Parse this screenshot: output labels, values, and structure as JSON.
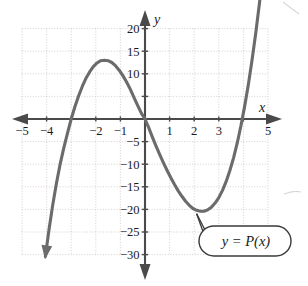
{
  "figure": {
    "axis_labels": {
      "x": "x",
      "y": "y"
    },
    "callout_text": "y = P(x)",
    "x_tick_labels": [
      "−5",
      "−4",
      "−2",
      "−1",
      "1",
      "2",
      "3",
      "5"
    ],
    "y_tick_labels": [
      "20",
      "15",
      "10",
      "−5",
      "−10",
      "−15",
      "−20",
      "−25",
      "−30"
    ],
    "colors": {
      "curve": "#6b6b6b",
      "axis": "#4a4a4a",
      "grid": "#c9b9b9",
      "text": "#1a1a1a",
      "callout_border": "#3a3a3a",
      "background": "#ffffff"
    }
  },
  "chart_data": {
    "type": "line",
    "title": "",
    "subtitle": "",
    "xlabel": "x",
    "ylabel": "y",
    "xlim": [
      -5,
      5
    ],
    "ylim": [
      -30,
      20
    ],
    "grid": true,
    "grid_x_step": 1,
    "grid_y_step": 5,
    "x_ticks": [
      -5,
      -4,
      -3,
      -2,
      -1,
      1,
      2,
      3,
      4,
      5
    ],
    "x_tick_labels": [
      "−5",
      "−4",
      "",
      "−2",
      "−1",
      "1",
      "2",
      "3",
      "",
      "5"
    ],
    "y_ticks": [
      20,
      15,
      10,
      5,
      -5,
      -10,
      -15,
      -20,
      -25,
      -30
    ],
    "y_tick_labels": [
      "20",
      "15",
      "10",
      "",
      "−5",
      "−10",
      "−15",
      "−20",
      "−25",
      "−30"
    ],
    "legend": [],
    "legend_position": "none",
    "annotations": [
      {
        "text": "y = P(x)",
        "points_to_x": 2.3,
        "points_to_y": -20.5,
        "label_x": 3.6,
        "label_y": -25.5
      }
    ],
    "series": [
      {
        "name": "y = P(x)",
        "kind": "cubic",
        "roots": [
          -3.0,
          0.0,
          4.3
        ],
        "local_max": {
          "x": -1.75,
          "y": 13.0
        },
        "local_min": {
          "x": 2.3,
          "y": -20.5
        },
        "x": [
          -4.05,
          -3.9,
          -3.75,
          -3.6,
          -3.45,
          -3.3,
          -3.15,
          -3.0,
          -2.85,
          -2.7,
          -2.55,
          -2.4,
          -2.25,
          -2.1,
          -1.95,
          -1.8,
          -1.65,
          -1.5,
          -1.35,
          -1.2,
          -1.05,
          -0.9,
          -0.75,
          -0.6,
          -0.45,
          -0.3,
          -0.15,
          0.0,
          0.15,
          0.3,
          0.45,
          0.6,
          0.75,
          0.9,
          1.05,
          1.2,
          1.35,
          1.5,
          1.65,
          1.8,
          1.95,
          2.1,
          2.25,
          2.4,
          2.55,
          2.7,
          2.85,
          3.0,
          3.15,
          3.3,
          3.45,
          3.6,
          3.75,
          3.9,
          4.05,
          4.2,
          4.35,
          4.5,
          4.65,
          4.8
        ],
        "y": [
          -30.4,
          -24.4,
          -19.0,
          -14.2,
          -10.0,
          -6.4,
          -3.1,
          0.0,
          2.7,
          5.1,
          7.2,
          9.0,
          10.4,
          11.6,
          12.4,
          12.9,
          13.0,
          12.9,
          12.5,
          11.8,
          10.8,
          9.6,
          8.2,
          6.6,
          4.8,
          3.0,
          1.3,
          0.0,
          -1.9,
          -4.0,
          -6.0,
          -7.9,
          -9.7,
          -11.4,
          -13.0,
          -14.5,
          -15.9,
          -17.1,
          -18.2,
          -19.1,
          -19.8,
          -20.2,
          -20.4,
          -20.4,
          -20.1,
          -19.5,
          -18.6,
          -17.4,
          -15.8,
          -13.8,
          -11.4,
          -8.6,
          -5.3,
          -1.5,
          2.8,
          7.6,
          13.0,
          18.9,
          25.5,
          32.6
        ]
      }
    ]
  }
}
